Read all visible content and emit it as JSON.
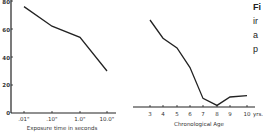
{
  "chart_data": [
    {
      "type": "line",
      "title": "",
      "xlabel": "Exposure time in seconds",
      "ylabel": "",
      "categories": [
        ".01\"",
        ".10\"",
        "1.0\"",
        "10.0\""
      ],
      "values": [
        76,
        62,
        54,
        30
      ],
      "yticks": [
        "0",
        "20",
        "40",
        "60",
        "80"
      ],
      "ylim": [
        0,
        80
      ],
      "grid": false
    },
    {
      "type": "line",
      "title": "",
      "xlabel": "Chronological Age",
      "ylabel": "",
      "categories": [
        "3",
        "4",
        "5",
        "6",
        "7",
        "8",
        "9",
        "10 yrs."
      ],
      "values": [
        65,
        52,
        45,
        31,
        9,
        4,
        10,
        11
      ],
      "ylim": [
        0,
        80
      ],
      "grid": false
    }
  ],
  "left": {
    "yticks": [
      "0",
      "20",
      "40",
      "60",
      "80"
    ],
    "xticks": [
      ".01\"",
      ".10\"",
      "1.0\"",
      "10.0\""
    ],
    "xlabel": "Exposure time in seconds"
  },
  "right": {
    "xticks": [
      "3",
      "4",
      "5",
      "6",
      "7",
      "8",
      "9",
      "10",
      "yrs."
    ],
    "xlabel": "Chronological Age"
  },
  "caption": {
    "lines": [
      "Fi",
      "ir",
      "a",
      "p"
    ]
  }
}
